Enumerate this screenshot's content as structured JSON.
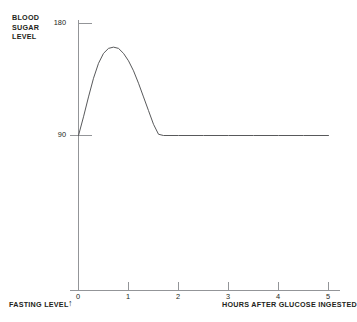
{
  "axes": {
    "y_title": "BLOOD\nSUGAR\nLEVEL",
    "x_title": "HOURS AFTER GLUCOSE INGESTED",
    "fasting_label": "FASTING LEVEL",
    "fasting_arrow_glyph": "↑"
  },
  "ticks": {
    "y": [
      "180",
      "90"
    ],
    "x": [
      "0",
      "1",
      "2",
      "3",
      "4",
      "5"
    ]
  },
  "chart_data": {
    "type": "line",
    "title": "",
    "subtitle": "",
    "xlabel": "HOURS AFTER GLUCOSE INGESTED",
    "ylabel": "BLOOD SUGAR LEVEL",
    "xlim": [
      0,
      5
    ],
    "ylim": [
      0,
      180
    ],
    "xticks": [
      0,
      1,
      2,
      3,
      4,
      5
    ],
    "yticks": [
      90,
      180
    ],
    "grid": false,
    "legend": null,
    "annotations": [
      {
        "text": "FASTING LEVEL",
        "x": 0,
        "y": 90,
        "marker": "up-arrow",
        "note": "arrow at origin marking the fasting baseline of 90"
      }
    ],
    "series": [
      {
        "name": "Blood sugar level after glucose ingestion",
        "x": [
          0.0,
          0.1,
          0.2,
          0.3,
          0.4,
          0.5,
          0.6,
          0.7,
          0.8,
          0.9,
          1.0,
          1.1,
          1.2,
          1.3,
          1.4,
          1.5,
          1.6,
          1.7,
          2.0,
          2.5,
          3.0,
          3.5,
          4.0,
          4.5,
          5.0
        ],
        "y": [
          90,
          105,
          121,
          136,
          148,
          156,
          160,
          161,
          160,
          156,
          150,
          142,
          132,
          121,
          110,
          99,
          91,
          90,
          90,
          90,
          90,
          90,
          90,
          90,
          90
        ],
        "color": "#58595b",
        "linewidth": 1
      }
    ]
  },
  "colors": {
    "axis": "#939598",
    "curve": "#58595b",
    "text": "#231f20",
    "background": "#ffffff"
  }
}
